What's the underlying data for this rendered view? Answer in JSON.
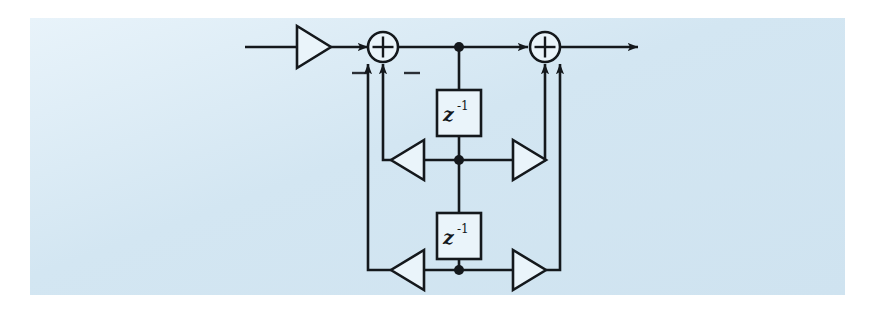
{
  "figure": {
    "kind": "signal-flow-graph",
    "panel_color": "#d8e9f2",
    "page_color": "#ffffff",
    "line_color": "#14181c",
    "block_fill": "#eaf4fa"
  },
  "labels": {
    "delay_base": "z",
    "delay_exponent": "-1",
    "adder_plus": "+",
    "minus_sign": "−"
  },
  "blocks": {
    "input_gain": {
      "name": "input-gain-triangle",
      "direction": "right"
    },
    "left_adder": {
      "name": "summing-junction-left",
      "symbol": "+",
      "input_signs": [
        "−",
        "−"
      ]
    },
    "right_adder": {
      "name": "summing-junction-right",
      "symbol": "+",
      "input_signs": []
    },
    "delay_1": {
      "name": "unit-delay-upper",
      "text": "z",
      "exponent": "-1"
    },
    "delay_2": {
      "name": "unit-delay-lower",
      "text": "z",
      "exponent": "-1"
    },
    "feedback_gain_1": {
      "name": "feedback-gain-upper",
      "direction": "left"
    },
    "feedback_gain_2": {
      "name": "feedback-gain-lower",
      "direction": "left"
    },
    "feedforward_gain_1": {
      "name": "feedforward-gain-upper",
      "direction": "right"
    },
    "feedforward_gain_2": {
      "name": "feedforward-gain-lower",
      "direction": "right"
    }
  },
  "signals": {
    "input_line": "input-signal-line",
    "output_line": "output-signal-line",
    "trunk_line": "central-state-trunk"
  }
}
